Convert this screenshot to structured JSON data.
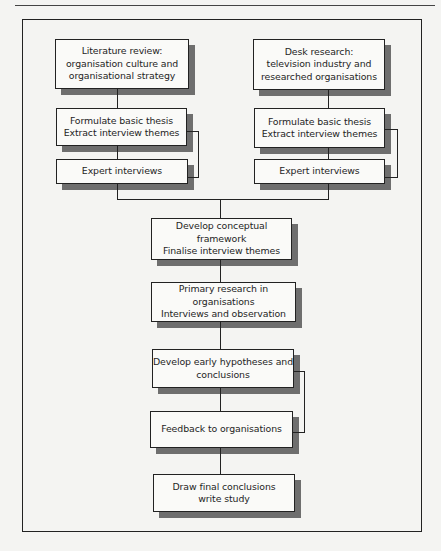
{
  "diagram": {
    "type": "flowchart",
    "left_branch": {
      "start": "Literature review:\norganisation culture and\norganisational strategy",
      "thesis": "Formulate basic thesis\nExtract interview themes",
      "interviews": "Expert interviews"
    },
    "right_branch": {
      "start": "Desk research:\ntelevision industry and\nresearched organisations",
      "thesis": "Formulate basic thesis\nExtract interview themes",
      "interviews": "Expert interviews"
    },
    "main_flow": [
      "Develop conceptual framework\nFinalise interview themes",
      "Primary research in organisations\nInterviews and observation",
      "Develop early hypotheses and\nconclusions",
      "Feedback to organisations",
      "Draw final conclusions\nwrite study"
    ],
    "feedback_loops": [
      {
        "from": "left_branch.interviews",
        "to": "left_branch.thesis"
      },
      {
        "from": "right_branch.interviews",
        "to": "right_branch.thesis"
      },
      {
        "from": "main_flow.3",
        "to": "main_flow.2"
      }
    ]
  },
  "colors": {
    "border": "#222222",
    "shadow": "#6e6e6e",
    "box_fill": "#fafaf8",
    "background": "#f4f4f2"
  }
}
